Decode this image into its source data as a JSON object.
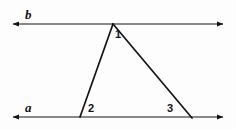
{
  "figure": {
    "background_color": "#fdfdfd",
    "stroke_color": "#141414",
    "width": 236,
    "height": 129
  },
  "lines": [
    {
      "id": "line-b",
      "label": "b",
      "role": "upper-parallel-line",
      "y": 24,
      "x_start": 13,
      "x_end": 223,
      "arrow_start": true,
      "arrow_end": true
    },
    {
      "id": "line-a",
      "label": "a",
      "role": "lower-parallel-line",
      "y": 117,
      "x_start": 13,
      "x_end": 223,
      "arrow_start": true,
      "arrow_end": true
    }
  ],
  "triangle": {
    "id": "triangle",
    "vertices": [
      {
        "name": "apex",
        "x": 113,
        "y": 24
      },
      {
        "name": "bottom-left",
        "x": 80,
        "y": 117
      },
      {
        "name": "bottom-right",
        "x": 192,
        "y": 118
      }
    ],
    "sides": [
      {
        "name": "left-side",
        "from": "apex",
        "to": "bottom-left"
      },
      {
        "name": "right-side",
        "from": "apex",
        "to": "bottom-right"
      },
      {
        "name": "base",
        "from": "bottom-left",
        "to": "bottom-right"
      }
    ]
  },
  "angle_labels": [
    {
      "id": "angle-1",
      "text": "1",
      "at_vertex": "apex",
      "x": 115,
      "y": 29
    },
    {
      "id": "angle-2",
      "text": "2",
      "at_vertex": "bottom-left",
      "x": 88,
      "y": 103
    },
    {
      "id": "angle-3",
      "text": "3",
      "at_vertex": "bottom-right",
      "x": 167,
      "y": 103
    }
  ]
}
